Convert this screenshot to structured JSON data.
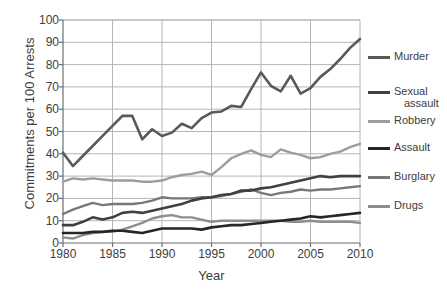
{
  "chart_data": {
    "type": "line",
    "title": "",
    "xlabel": "Year",
    "ylabel": "Commitments per 100 Arrests",
    "xlim": [
      1980,
      2010
    ],
    "ylim": [
      0,
      100
    ],
    "ytick_labels": [
      "0",
      "10",
      "20",
      "30",
      "40",
      "50",
      "60",
      "70",
      "80",
      "90",
      "100"
    ],
    "ytick_values": [
      0,
      10,
      20,
      30,
      40,
      50,
      60,
      70,
      80,
      90,
      100
    ],
    "xtick_labels": [
      "1980",
      "1985",
      "1990",
      "1995",
      "2000",
      "2005",
      "2010"
    ],
    "xtick_values": [
      1980,
      1985,
      1990,
      1995,
      2000,
      2005,
      2010
    ],
    "grid": "both",
    "legend_position": "right",
    "x": [
      1980,
      1981,
      1982,
      1983,
      1984,
      1985,
      1986,
      1987,
      1988,
      1989,
      1990,
      1991,
      1992,
      1993,
      1994,
      1995,
      1996,
      1997,
      1998,
      1999,
      2000,
      2001,
      2002,
      2003,
      2004,
      2005,
      2006,
      2007,
      2008,
      2009,
      2010
    ],
    "series": [
      {
        "name": "Murder",
        "color": "#595959",
        "width": 2.6,
        "values": [
          40.5,
          34.5,
          39.0,
          43.5,
          48.0,
          52.5,
          57.0,
          57.0,
          46.5,
          51.0,
          48.0,
          49.5,
          53.5,
          51.5,
          56.0,
          58.5,
          59.0,
          61.5,
          61.0,
          69.0,
          76.5,
          70.5,
          68.0,
          75.0,
          67.0,
          69.5,
          74.5,
          78.0,
          82.5,
          87.5,
          91.5
        ]
      },
      {
        "name": "Sexual assault",
        "color": "#404040",
        "width": 2.6,
        "values": [
          8.0,
          8.0,
          9.5,
          11.5,
          10.5,
          11.5,
          13.5,
          14.0,
          13.5,
          14.5,
          15.5,
          16.5,
          17.5,
          19.0,
          20.0,
          20.5,
          21.5,
          22.0,
          23.5,
          23.5,
          24.5,
          25.0,
          26.0,
          27.0,
          28.0,
          29.0,
          30.0,
          29.5,
          30.0,
          30.0,
          30.0
        ]
      },
      {
        "name": "Robbery",
        "color": "#9d9d9d",
        "width": 2.4,
        "values": [
          27.5,
          29.0,
          28.5,
          29.0,
          28.5,
          28.0,
          28.0,
          28.0,
          27.5,
          27.5,
          28.0,
          29.5,
          30.5,
          31.0,
          32.0,
          30.5,
          34.0,
          38.0,
          40.0,
          41.5,
          39.5,
          38.5,
          42.0,
          40.5,
          39.5,
          38.0,
          38.5,
          40.0,
          41.0,
          43.0,
          44.5
        ]
      },
      {
        "name": "Assault",
        "color": "#262626",
        "width": 2.6,
        "values": [
          4.5,
          4.5,
          4.5,
          5.0,
          5.0,
          5.5,
          5.5,
          5.0,
          4.5,
          5.5,
          6.5,
          6.5,
          6.5,
          6.5,
          6.0,
          7.0,
          7.5,
          8.0,
          8.0,
          8.5,
          9.0,
          9.5,
          10.0,
          10.5,
          11.0,
          12.0,
          11.5,
          12.0,
          12.5,
          13.0,
          13.5
        ]
      },
      {
        "name": "Burglary",
        "color": "#787878",
        "width": 2.4,
        "values": [
          13.0,
          15.0,
          16.5,
          18.0,
          17.0,
          17.5,
          17.5,
          17.5,
          18.0,
          19.0,
          20.5,
          20.0,
          20.0,
          20.0,
          20.5,
          20.5,
          21.0,
          22.0,
          23.0,
          24.0,
          22.5,
          21.5,
          22.5,
          23.0,
          24.0,
          23.5,
          24.0,
          24.0,
          24.5,
          25.0,
          25.5
        ]
      },
      {
        "name": "Drugs",
        "color": "#8e8e8e",
        "width": 2.4,
        "values": [
          2.5,
          2.0,
          3.5,
          4.5,
          5.0,
          5.0,
          6.0,
          7.5,
          9.0,
          11.0,
          12.0,
          12.5,
          11.5,
          11.5,
          10.5,
          9.5,
          10.0,
          10.0,
          10.0,
          10.0,
          10.0,
          10.0,
          10.0,
          9.5,
          9.5,
          10.0,
          9.5,
          9.5,
          9.5,
          9.5,
          9.0
        ]
      }
    ]
  },
  "legend": {
    "items": [
      {
        "label": "Murder",
        "color": "#595959"
      },
      {
        "label": "Sexual\nassault",
        "color": "#404040"
      },
      {
        "label": "Robbery",
        "color": "#9d9d9d"
      },
      {
        "label": "Assault",
        "color": "#262626"
      },
      {
        "label": "Burglary",
        "color": "#787878"
      },
      {
        "label": "Drugs",
        "color": "#8e8e8e"
      }
    ]
  },
  "style": {
    "grid_color": "#b5b5b5",
    "axis_color": "#6e6e6e",
    "text_color": "#404040",
    "background": "#ffffff"
  }
}
